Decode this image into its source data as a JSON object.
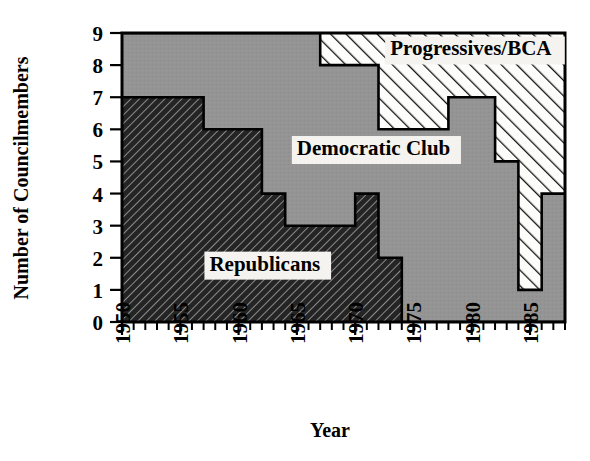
{
  "chart_data": {
    "type": "area",
    "title": "",
    "xlabel": "Year",
    "ylabel": "Number of Councilmembers",
    "xlim": [
      1950,
      1988
    ],
    "ylim": [
      0,
      9
    ],
    "grid": false,
    "legend_position": "inline-annotations",
    "x_ticks_major": [
      1950,
      1955,
      1960,
      1965,
      1970,
      1975,
      1980,
      1985
    ],
    "x_tick_labels": [
      "1950",
      "1955",
      "1960",
      "1965",
      "1970",
      "1975",
      "1980",
      "1985"
    ],
    "x_tick_minor_step": 1,
    "y_ticks": [
      0,
      1,
      2,
      3,
      4,
      5,
      6,
      7,
      8,
      9
    ],
    "y_tick_labels": [
      "0",
      "1",
      "2",
      "3",
      "4",
      "5",
      "6",
      "7",
      "8",
      "9"
    ],
    "stack_order_bottom_to_top": [
      "Republicans",
      "Democratic Club",
      "Progressives/BCA"
    ],
    "series": [
      {
        "name": "Republicans",
        "fill": "dark-hatch",
        "color": "#2b2b2b",
        "label_x": 1957.5,
        "label_y": 1.6,
        "steps": [
          {
            "year": 1950,
            "value": 7
          },
          {
            "year": 1957,
            "value": 6
          },
          {
            "year": 1962,
            "value": 4
          },
          {
            "year": 1964,
            "value": 3
          },
          {
            "year": 1970,
            "value": 4
          },
          {
            "year": 1972,
            "value": 2
          },
          {
            "year": 1974,
            "value": 0
          },
          {
            "year": 1988,
            "value": 0
          }
        ]
      },
      {
        "name": "Democratic Club",
        "fill": "solid-gray",
        "color": "#8f8f8f",
        "label_x": 1965.0,
        "label_y": 5.2,
        "steps": [
          {
            "year": 1950,
            "value": 2
          },
          {
            "year": 1957,
            "value": 3
          },
          {
            "year": 1962,
            "value": 5
          },
          {
            "year": 1964,
            "value": 6
          },
          {
            "year": 1967,
            "value": 5
          },
          {
            "year": 1970,
            "value": 4
          },
          {
            "year": 1972,
            "value": 4
          },
          {
            "year": 1974,
            "value": 6
          },
          {
            "year": 1978,
            "value": 7
          },
          {
            "year": 1982,
            "value": 5
          },
          {
            "year": 1984,
            "value": 1
          },
          {
            "year": 1986,
            "value": 4
          },
          {
            "year": 1988,
            "value": 4
          }
        ]
      },
      {
        "name": "Progressives/BCA",
        "fill": "white-hatch",
        "color": "#ffffff",
        "label_x": 1973.0,
        "label_y": 8.3,
        "steps": [
          {
            "year": 1950,
            "value": 0
          },
          {
            "year": 1967,
            "value": 1
          },
          {
            "year": 1972,
            "value": 3
          },
          {
            "year": 1974,
            "value": 3
          },
          {
            "year": 1978,
            "value": 2
          },
          {
            "year": 1982,
            "value": 4
          },
          {
            "year": 1984,
            "value": 8
          },
          {
            "year": 1986,
            "value": 5
          },
          {
            "year": 1988,
            "value": 5
          }
        ]
      }
    ],
    "cumulative_tops": {
      "note": "Top boundary of each stacked band, as number of councilmembers (0-9 scale)",
      "republicans_top": [
        {
          "year": 1950,
          "value": 7
        },
        {
          "year": 1957,
          "value": 6
        },
        {
          "year": 1962,
          "value": 4
        },
        {
          "year": 1964,
          "value": 3
        },
        {
          "year": 1970,
          "value": 4
        },
        {
          "year": 1972,
          "value": 2
        },
        {
          "year": 1974,
          "value": 0
        }
      ],
      "democrats_top": [
        {
          "year": 1950,
          "value": 9
        },
        {
          "year": 1967,
          "value": 8
        },
        {
          "year": 1972,
          "value": 6
        },
        {
          "year": 1978,
          "value": 7
        },
        {
          "year": 1982,
          "value": 5
        },
        {
          "year": 1984,
          "value": 1
        },
        {
          "year": 1986,
          "value": 4
        }
      ]
    }
  },
  "labels": {
    "y_axis_title": "Number of Councilmembers",
    "x_axis_title": "Year",
    "republicans": "Republicans",
    "democratic_club": "Democratic Club",
    "progressives": "Progressives/BCA"
  },
  "colors": {
    "republicans": "#2b2b2b",
    "democratic_club": "#8f8f8f",
    "progressives": "#ffffff",
    "axis": "#000000",
    "background": "#ffffff",
    "label_halo": "#f5f3ef"
  }
}
